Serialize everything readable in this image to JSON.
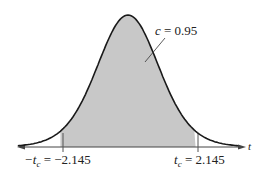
{
  "chart_data": {
    "type": "area",
    "title": "",
    "distribution": "t-distribution",
    "xlabel": "t",
    "ylabel": "",
    "grid": false,
    "legend": null,
    "shaded_region": {
      "from": -2.145,
      "to": 2.145,
      "area": 0.95
    },
    "annotations": [
      {
        "text": "c = 0.95",
        "target": "shaded area"
      },
      {
        "text": "-t_c = -2.145",
        "x": -2.145
      },
      {
        "text": "t_c = 2.145",
        "x": 2.145
      }
    ]
  },
  "labels": {
    "c_var": "c",
    "c_eq": " = 0.95",
    "neg_t": "−t",
    "sub_c": "c",
    "neg_eq": " = −2.145",
    "pos_t": "t",
    "pos_eq": " = 2.145",
    "axis": "t"
  },
  "colors": {
    "shade": "#c8c8c8",
    "curve": "#1a1a1a",
    "axis": "#444444"
  }
}
